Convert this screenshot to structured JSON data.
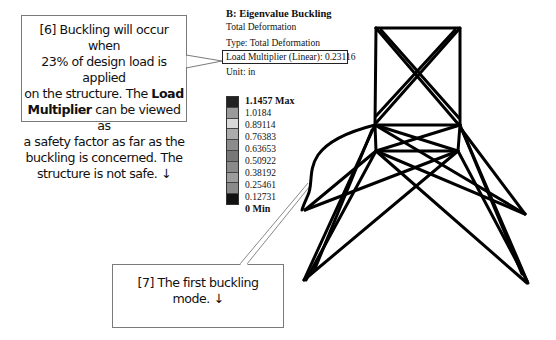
{
  "callouts": {
    "step6": {
      "line1": "[6] Buckling will occur when",
      "line2": "23% of design load is applied",
      "line3a": "on the structure. The ",
      "line3b": "Load",
      "line4a": "Multiplier",
      "line4b": " can be viewed as",
      "line5": "a safety factor as far as the",
      "line6": "buckling is concerned. The",
      "line7": "structure is not safe. ↓"
    },
    "step7": {
      "line1": "[7] The first buckling",
      "line2": "mode. ↓"
    }
  },
  "result": {
    "title": "B: Eigenvalue Buckling",
    "name": "Total Deformation",
    "type": "Type: Total Deformation",
    "load_multiplier": "Load Multiplier (Linear): 0.23116",
    "unit": "Unit: in"
  },
  "legend": {
    "labels": [
      "1.1457 Max",
      "1.0184",
      "0.89114",
      "0.76383",
      "0.63653",
      "0.50922",
      "0.38192",
      "0.25461",
      "0.12731",
      "0 Min"
    ],
    "band_colors": [
      "#222222",
      "#9a9a9a",
      "#d9d9d9",
      "#acacac",
      "#8c8c8c",
      "#777777",
      "#8a8a8a",
      "#9c9c9c",
      "#8a8a8a",
      "#111111"
    ]
  },
  "model": {
    "description": "Tower frame, first buckling mode shape",
    "line_color": "#000000"
  }
}
